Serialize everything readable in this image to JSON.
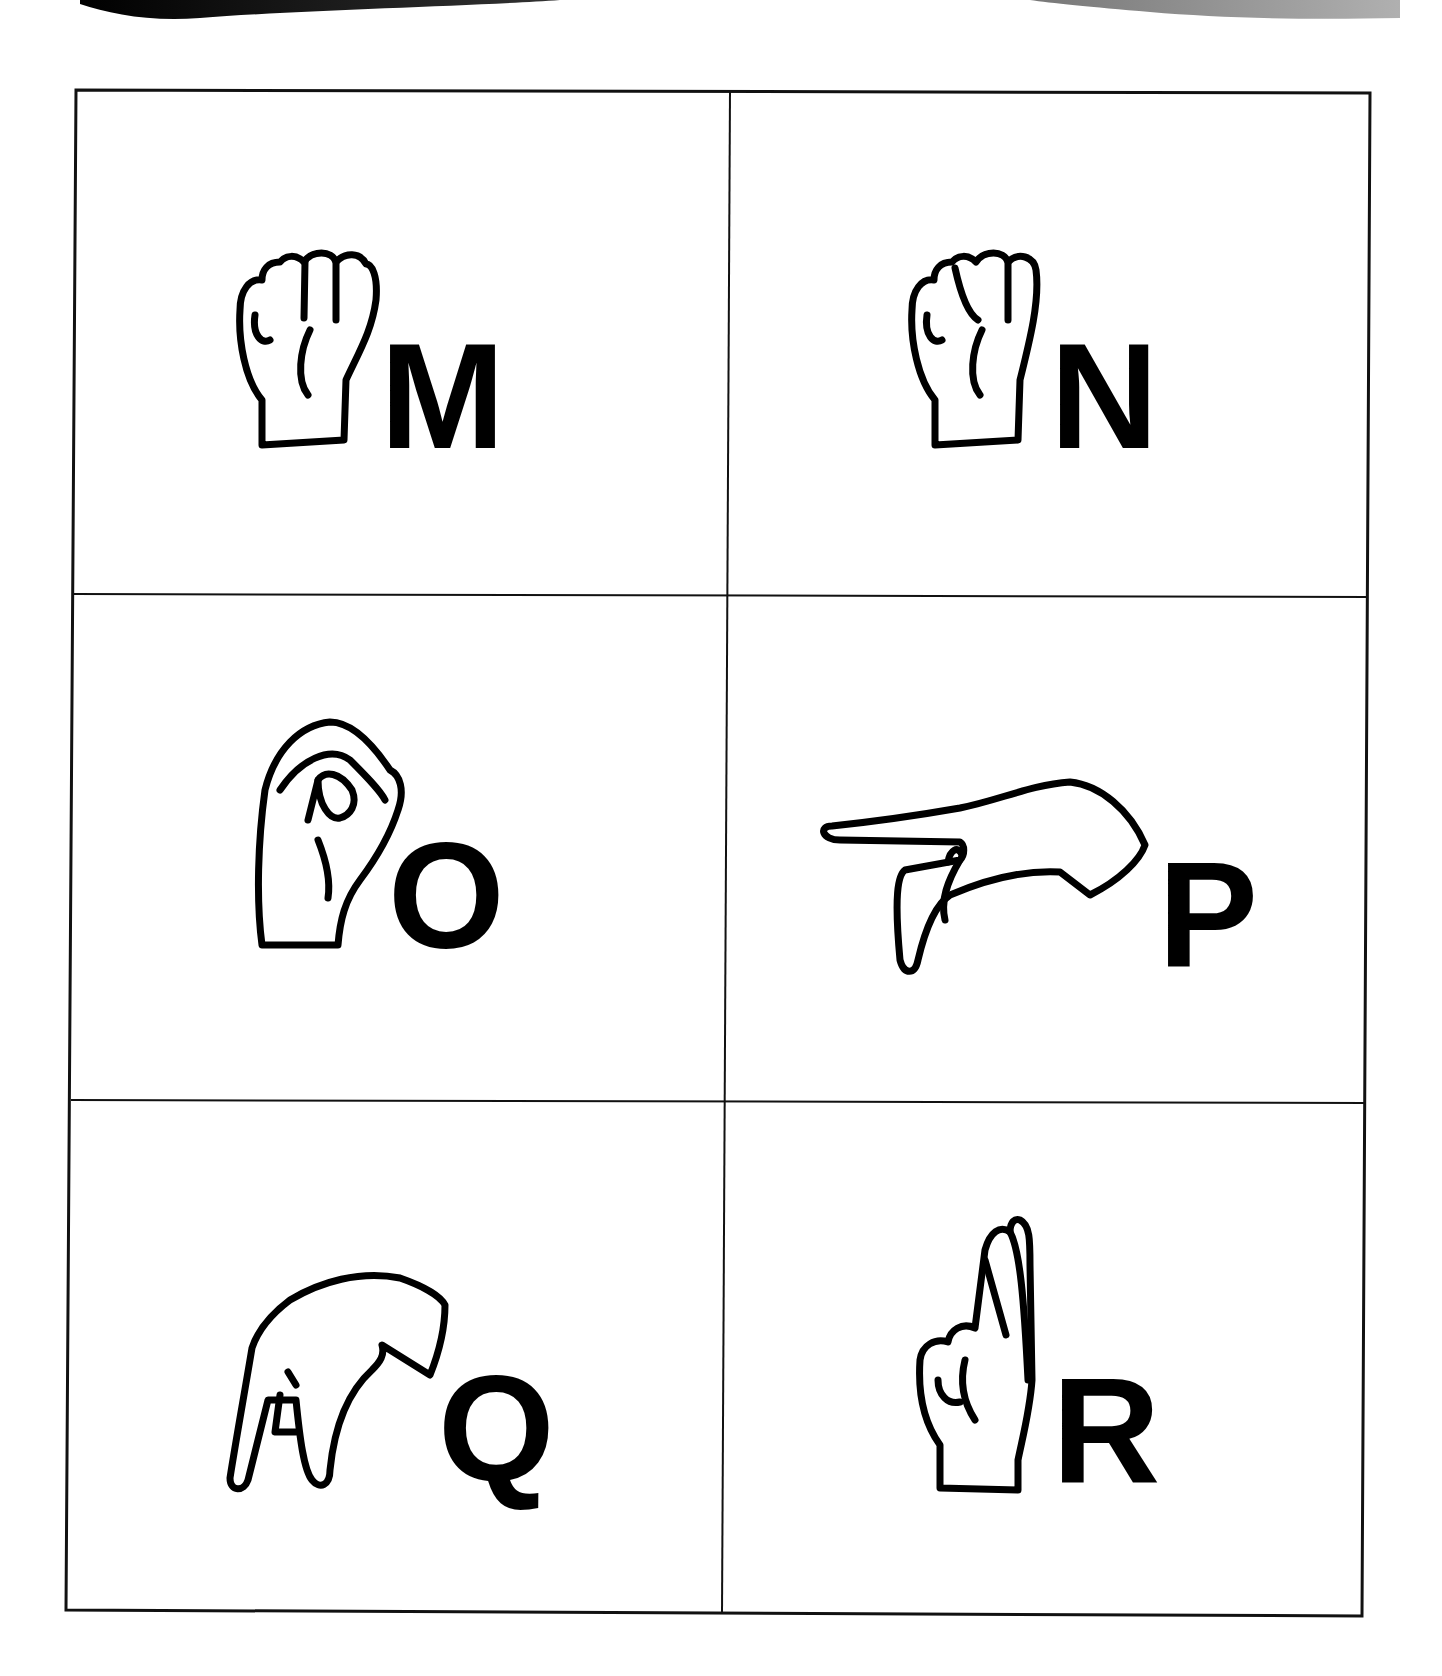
{
  "page": {
    "type": "ASL fingerspelling alphabet chart",
    "grid": {
      "rows": 3,
      "columns": 2
    }
  },
  "banner": {
    "left_swoosh_color": "#1a1a1a",
    "right_swoosh_color": "#a0a0a0"
  },
  "cards": [
    {
      "letter": "M",
      "handshape": "fist-thumb-under-three-fingers-icon"
    },
    {
      "letter": "N",
      "handshape": "fist-thumb-under-two-fingers-icon"
    },
    {
      "letter": "O",
      "handshape": "fingers-curved-to-thumb-circle-icon"
    },
    {
      "letter": "P",
      "handshape": "index-pointing-down-middle-extended-icon"
    },
    {
      "letter": "Q",
      "handshape": "index-and-thumb-pointing-down-icon"
    },
    {
      "letter": "R",
      "handshape": "crossed-index-middle-fingers-icon"
    }
  ]
}
